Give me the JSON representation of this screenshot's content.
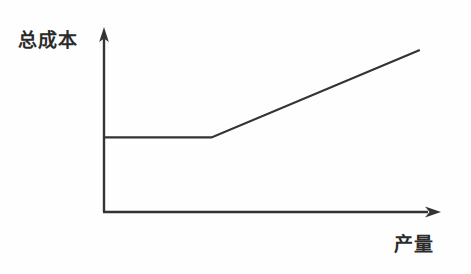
{
  "figure": {
    "background_color": "#fefefe",
    "ink_color": "#333333",
    "origin_label": "0",
    "y_axis_title": "总成本",
    "x_axis_title": "产量"
  },
  "chart_data": {
    "type": "line",
    "title": "",
    "subtitle": "",
    "xlabel": "产量",
    "ylabel": "总成本",
    "axis_style": "arrow-ended half-axes",
    "grid": false,
    "legend": false,
    "legend_position": "none",
    "origin_label": "0",
    "xlim": [
      0,
      100
    ],
    "ylim": [
      0,
      100
    ],
    "x_tick_labels": [],
    "y_tick_labels": [],
    "annotations": [],
    "series": [
      {
        "name": "总成本",
        "color": "#333333",
        "x": [
          0,
          32,
          94
        ],
        "y": [
          41,
          41,
          89
        ],
        "description": "固定段后转为线性上升的半变动成本线"
      }
    ],
    "breakpoints": [
      {
        "x": 32,
        "y": 41,
        "label": ""
      }
    ]
  }
}
